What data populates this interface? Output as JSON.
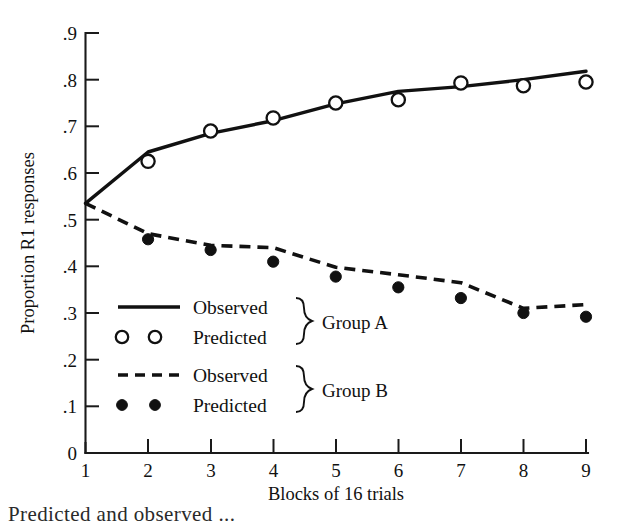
{
  "chart_data": {
    "type": "line",
    "title": "",
    "xlabel": "Blocks of 16 trials",
    "ylabel": "Proportion R1 responses",
    "x": [
      1,
      2,
      3,
      4,
      5,
      6,
      7,
      8,
      9
    ],
    "xticklabels": [
      "1",
      "2",
      "3",
      "4",
      "5",
      "6",
      "7",
      "8",
      "9"
    ],
    "yticklabels": [
      "0",
      ".1",
      ".2",
      ".3",
      ".4",
      ".5",
      ".6",
      ".7",
      ".8",
      ".9"
    ],
    "ytickvalues": [
      0,
      0.1,
      0.2,
      0.3,
      0.4,
      0.5,
      0.6,
      0.7,
      0.8,
      0.9
    ],
    "xlim": [
      1,
      9
    ],
    "ylim": [
      0,
      0.9
    ],
    "grid": false,
    "legend_position": "lower-left-inside",
    "series": [
      {
        "name": "Group A Observed",
        "group": "Group A",
        "kind": "observed",
        "style": "solid-line",
        "values": [
          0.535,
          0.645,
          0.685,
          0.712,
          0.748,
          0.775,
          0.785,
          0.8,
          0.818
        ]
      },
      {
        "name": "Group A Predicted",
        "group": "Group A",
        "kind": "predicted",
        "style": "open-circle",
        "x": [
          2,
          3,
          4,
          5,
          6,
          7,
          8,
          9
        ],
        "values": [
          0.625,
          0.69,
          0.718,
          0.75,
          0.757,
          0.793,
          0.787,
          0.795
        ]
      },
      {
        "name": "Group B Observed",
        "group": "Group B",
        "kind": "observed",
        "style": "dashed-line",
        "values": [
          0.535,
          0.47,
          0.445,
          0.44,
          0.398,
          0.382,
          0.365,
          0.31,
          0.318
        ]
      },
      {
        "name": "Group B Predicted",
        "group": "Group B",
        "kind": "predicted",
        "style": "filled-circle",
        "x": [
          2,
          3,
          4,
          5,
          6,
          7,
          8,
          9
        ],
        "values": [
          0.458,
          0.435,
          0.41,
          0.378,
          0.355,
          0.332,
          0.3,
          0.292
        ]
      }
    ]
  },
  "axes": {
    "y_title": "Proportion R1 responses",
    "x_title": "Blocks of 16 trials",
    "y_ticks": [
      "0",
      ".1",
      ".2",
      ".3",
      ".4",
      ".5",
      ".6",
      ".7",
      ".8",
      ".9"
    ],
    "x_ticks": [
      "1",
      "2",
      "3",
      "4",
      "5",
      "6",
      "7",
      "8",
      "9"
    ]
  },
  "legend": {
    "rows": [
      {
        "label": "Observed",
        "marker": "solid-line"
      },
      {
        "label": "Predicted",
        "marker": "open-circle"
      },
      {
        "label": "Observed",
        "marker": "dashed-line"
      },
      {
        "label": "Predicted",
        "marker": "filled-circle"
      }
    ],
    "group_a_label": "Group A",
    "group_b_label": "Group B"
  },
  "caption": {
    "text": "Predicted and observed ..."
  },
  "colors": {
    "ink": "#111111",
    "background": "#ffffff"
  }
}
